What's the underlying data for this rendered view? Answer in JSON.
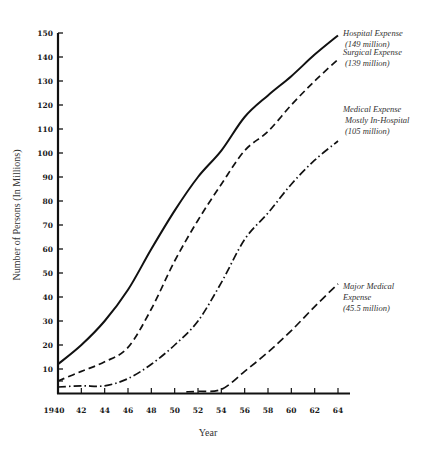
{
  "chart_data": {
    "type": "line",
    "title": "",
    "xlabel": "Year",
    "ylabel": "Number of Persons (In Millions)",
    "xlim": [
      1940,
      1964
    ],
    "ylim": [
      0,
      150
    ],
    "grid": false,
    "legend_position": "inline-right-annotations",
    "x_ticks": [
      "1940",
      "42",
      "44",
      "46",
      "48",
      "50",
      "52",
      "54",
      "56",
      "58",
      "60",
      "62",
      "64"
    ],
    "y_ticks": [
      "10",
      "20",
      "30",
      "40",
      "50",
      "60",
      "70",
      "80",
      "90",
      "100",
      "110",
      "120",
      "130",
      "140",
      "150"
    ],
    "series": [
      {
        "name": "Hospital Expense",
        "annotation": [
          "Hospital Expense",
          "(149 million)"
        ],
        "style": "solid",
        "x": [
          1940,
          1942,
          1944,
          1946,
          1948,
          1950,
          1952,
          1954,
          1956,
          1958,
          1960,
          1962,
          1964
        ],
        "values": [
          12,
          20,
          30,
          43,
          60,
          76,
          90,
          101,
          115,
          124,
          132,
          141,
          149
        ]
      },
      {
        "name": "Surgical Expense",
        "annotation": [
          "Surgical Expense",
          "(139 million)"
        ],
        "style": "dashed",
        "x": [
          1940,
          1942,
          1944,
          1946,
          1948,
          1950,
          1952,
          1954,
          1956,
          1958,
          1960,
          1962,
          1964
        ],
        "values": [
          5,
          9,
          13,
          19,
          35,
          55,
          72,
          87,
          101,
          109,
          120,
          130,
          139
        ]
      },
      {
        "name": "Medical Expense Mostly In-Hospital",
        "annotation": [
          "Medical Expense",
          "Mostly In-Hospital",
          "(105 million)"
        ],
        "style": "dash-dot",
        "x": [
          1940,
          1942,
          1944,
          1946,
          1948,
          1950,
          1952,
          1954,
          1956,
          1958,
          1960,
          1962,
          1964
        ],
        "values": [
          2.5,
          3,
          3,
          6,
          12,
          20,
          30,
          46,
          64,
          75,
          87,
          97,
          105
        ]
      },
      {
        "name": "Major Medical Expense",
        "annotation": [
          "Major  Medical",
          "Expense",
          "(45.5 million)"
        ],
        "style": "long-dash",
        "x": [
          1951,
          1952,
          1954,
          1956,
          1958,
          1960,
          1962,
          1964
        ],
        "values": [
          0.5,
          0.7,
          1.5,
          9,
          17,
          26,
          36,
          45.5
        ]
      }
    ]
  }
}
